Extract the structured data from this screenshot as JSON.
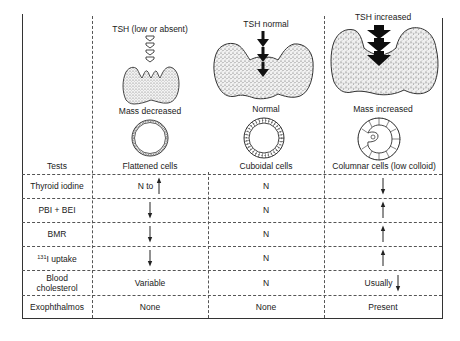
{
  "figure": {
    "columns": [
      {
        "key": "decreased",
        "tsh_label": "TSH (low or absent)",
        "tsh_arrow_style": "hollow",
        "tsh_arrow_count": 4,
        "mass_label": "Mass decreased",
        "cell_label": "Flattened cells"
      },
      {
        "key": "normal",
        "tsh_label": "TSH normal",
        "tsh_arrow_style": "solid-thin",
        "tsh_arrow_count": 3,
        "mass_label": "Normal",
        "cell_label": "Cuboidal cells"
      },
      {
        "key": "increased",
        "tsh_label": "TSH increased",
        "tsh_arrow_style": "solid-bold",
        "tsh_arrow_count": 3,
        "mass_label": "Mass increased",
        "cell_label": "Columnar cells (low colloid)"
      }
    ]
  },
  "table": {
    "header_label": "Tests",
    "rows": [
      {
        "test": "Thyroid iodine",
        "values": [
          {
            "text": "N to",
            "arrow": "up"
          },
          {
            "text": "N",
            "arrow": ""
          },
          {
            "text": "",
            "arrow": "down"
          }
        ]
      },
      {
        "test": "PBI + BEI",
        "values": [
          {
            "text": "",
            "arrow": "down"
          },
          {
            "text": "N",
            "arrow": ""
          },
          {
            "text": "",
            "arrow": "up"
          }
        ]
      },
      {
        "test": "BMR",
        "values": [
          {
            "text": "",
            "arrow": "down"
          },
          {
            "text": "N",
            "arrow": ""
          },
          {
            "text": "",
            "arrow": "up"
          }
        ]
      },
      {
        "test_sup": "131",
        "test": "I uptake",
        "values": [
          {
            "text": "",
            "arrow": "down"
          },
          {
            "text": "N",
            "arrow": ""
          },
          {
            "text": "",
            "arrow": "up"
          }
        ]
      },
      {
        "test_line1": "Blood",
        "test_line2": "cholesterol",
        "values": [
          {
            "text": "Variable",
            "arrow": ""
          },
          {
            "text": "N",
            "arrow": ""
          },
          {
            "text": "Usually",
            "arrow": "down"
          }
        ]
      },
      {
        "test": "Exophthalmos",
        "values": [
          {
            "text": "None",
            "arrow": ""
          },
          {
            "text": "None",
            "arrow": ""
          },
          {
            "text": "Present",
            "arrow": ""
          }
        ]
      }
    ]
  }
}
